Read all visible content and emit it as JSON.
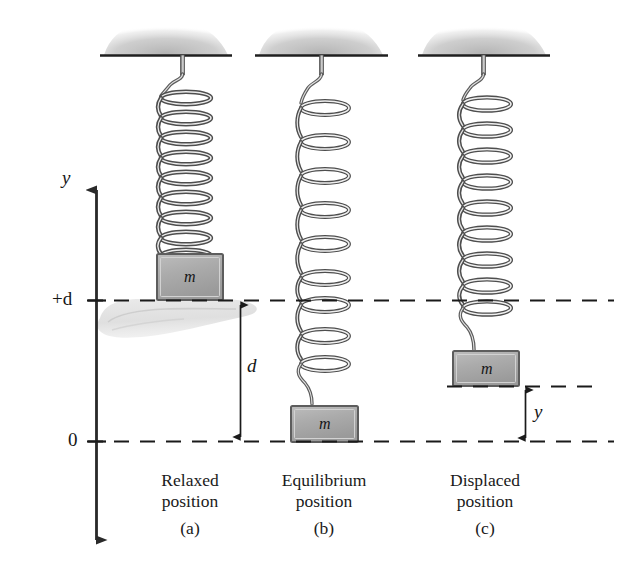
{
  "figure": {
    "axis": {
      "vertical_axis_label": "y",
      "ticks": [
        {
          "label": "+d",
          "value": "+d"
        },
        {
          "label": "0",
          "value": "0"
        }
      ]
    },
    "dimensions": [
      {
        "name": "d",
        "label": "d",
        "description": "distance from +d line to 0 line"
      },
      {
        "name": "y",
        "label": "y",
        "description": "displacement below block in panel c to 0 line"
      }
    ],
    "panels": [
      {
        "id": "a",
        "caption_line1": "Relaxed",
        "caption_line2": "position",
        "letter": "(a)",
        "mass_label": "m",
        "spring_state": "relaxed",
        "coils": 10,
        "hand_present": true
      },
      {
        "id": "b",
        "caption_line1": "Equilibrium",
        "caption_line2": "position",
        "letter": "(b)",
        "mass_label": "m",
        "spring_state": "stretched",
        "coils": 10,
        "hand_present": false
      },
      {
        "id": "c",
        "caption_line1": "Displaced",
        "caption_line2": "position",
        "letter": "(c)",
        "mass_label": "m",
        "spring_state": "partially-stretched",
        "coils": 10,
        "hand_present": false
      }
    ],
    "colors": {
      "ink": "#1a1a1a",
      "block_fill": "#a9a9a9",
      "block_edge": "#4a4a4a",
      "spring_dark": "#4f4f4f",
      "spring_light": "#d8d8d8",
      "ceiling_gray": "#b8b8b8",
      "hand_gray": "#dcdcdc",
      "background": "#ffffff"
    }
  }
}
